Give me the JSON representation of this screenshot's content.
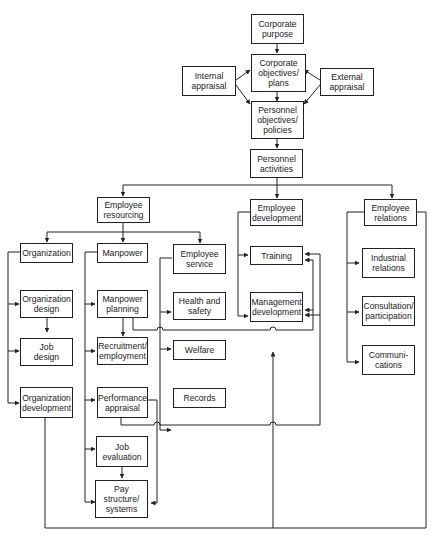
{
  "diagram": {
    "nodes": {
      "corporate_purpose": "Corporate\npurpose",
      "corporate_objectives": "Corporate\nobjectives/\nplans",
      "internal_appraisal": "Internal\nappraisal",
      "external_appraisal": "External\nappraisal",
      "personnel_objectives": "Personnel\nobjectives/\npolicies",
      "personnel_activities": "Personnel\nactivities",
      "employee_resourcing": "Employee\nresourcing",
      "employee_development": "Employee\ndevelopment",
      "employee_relations": "Employee\nrelations",
      "organization": "Organization",
      "organization_design": "Organization\ndesign",
      "job_design": "Job\ndesign",
      "organization_development": "Organization\ndevelopment",
      "manpower": "Manpower",
      "manpower_planning": "Manpower\nplanning",
      "recruitment": "Recruitment/\nemployment",
      "performance_appraisal": "Performance\nappraisal",
      "job_evaluation": "Job\nevaluation",
      "pay_structure": "Pay\nstructure/\nsystems",
      "employee_service": "Employee\nservice",
      "health_safety": "Health and\nsafety",
      "welfare": "Welfare",
      "records": "Records",
      "training": "Training",
      "management_development": "Management\ndevelopment",
      "industrial_relations": "Industrial\nrelations",
      "consultation": "Consultation/\nparticipation",
      "communications": "Communi-\ncations"
    },
    "line_color": "#222222"
  }
}
